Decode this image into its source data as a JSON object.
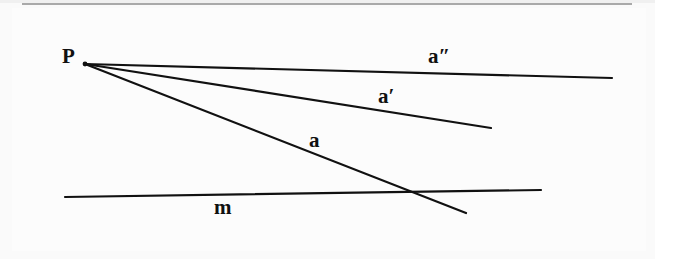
{
  "figure": {
    "kind": "geometry-diagram",
    "background_color": "#fcfcfc",
    "ink_color": "#111111",
    "top_rule_color": "#9a9a9a"
  },
  "labels": {
    "point_p": "P",
    "ray_a": "a",
    "ray_a_prime": "a′",
    "ray_a_double_prime": "a″",
    "line_m": "m"
  },
  "geometry": {
    "vertex": {
      "label": "P",
      "x": 85,
      "y": 64
    },
    "lines": [
      {
        "name": "a-double-prime",
        "label": "a″",
        "x1": 85,
        "y1": 64,
        "x2": 612,
        "y2": 78,
        "stroke_width": 2.2
      },
      {
        "name": "a-prime",
        "label": "a′",
        "x1": 85,
        "y1": 64,
        "x2": 491,
        "y2": 128,
        "stroke_width": 2.2
      },
      {
        "name": "a",
        "label": "a",
        "x1": 85,
        "y1": 64,
        "x2": 466,
        "y2": 213,
        "stroke_width": 2.2
      },
      {
        "name": "m",
        "label": "m",
        "x1": 65,
        "y1": 197,
        "x2": 541,
        "y2": 190,
        "stroke_width": 2.2
      }
    ],
    "intersection": {
      "of": [
        "a",
        "m"
      ],
      "x": 425,
      "y": 192
    }
  }
}
